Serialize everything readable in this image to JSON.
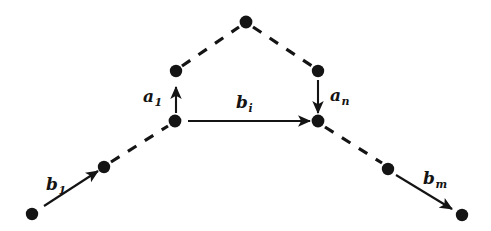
{
  "figure": {
    "type": "node-link-path-diagram",
    "background_color": "#ffffff",
    "ink_color": "#141414"
  },
  "labels": {
    "b1": {
      "base": "b",
      "sub": "1",
      "text": "b1"
    },
    "bi": {
      "base": "b",
      "sub": "i",
      "text": "bi"
    },
    "bm": {
      "base": "b",
      "sub": "m",
      "text": "bm"
    },
    "a1": {
      "base": "a",
      "sub": "1",
      "text": "a1"
    },
    "an": {
      "base": "a",
      "sub": "n",
      "text": "an"
    }
  },
  "nodes": [
    {
      "id": "bottom-left",
      "x": 32,
      "y": 214,
      "r": 6.2
    },
    {
      "id": "lower-left",
      "x": 104,
      "y": 167,
      "r": 6.2
    },
    {
      "id": "mid-left",
      "x": 175,
      "y": 121,
      "r": 6.4
    },
    {
      "id": "upper-left",
      "x": 176,
      "y": 71,
      "r": 6.2
    },
    {
      "id": "apex",
      "x": 246,
      "y": 22,
      "r": 6.4
    },
    {
      "id": "upper-right",
      "x": 318,
      "y": 71,
      "r": 6.2
    },
    {
      "id": "mid-right",
      "x": 318,
      "y": 121,
      "r": 6.4
    },
    {
      "id": "lower-right",
      "x": 388,
      "y": 169,
      "r": 6.2
    },
    {
      "id": "bottom-right",
      "x": 462,
      "y": 215,
      "r": 6.2
    }
  ],
  "edges": [
    {
      "id": "edge-b1",
      "style": "solid",
      "arrow": "end",
      "from": [
        44,
        206
      ],
      "to": [
        98,
        171
      ],
      "label": "b1"
    },
    {
      "id": "edge-dash-ll",
      "style": "dashed",
      "arrow": "none",
      "from": [
        111,
        162
      ],
      "to": [
        168,
        126
      ],
      "label": ""
    },
    {
      "id": "edge-a1",
      "style": "solid",
      "arrow": "end",
      "from": [
        176,
        113
      ],
      "to": [
        176,
        87
      ],
      "label": "a1"
    },
    {
      "id": "edge-dash-ul",
      "style": "dashed",
      "arrow": "none",
      "from": [
        182,
        66
      ],
      "to": [
        239,
        27
      ],
      "label": ""
    },
    {
      "id": "edge-dash-ur",
      "style": "dashed",
      "arrow": "none",
      "from": [
        253,
        27
      ],
      "to": [
        312,
        66
      ],
      "label": ""
    },
    {
      "id": "edge-an",
      "style": "solid",
      "arrow": "end",
      "from": [
        318,
        80
      ],
      "to": [
        318,
        113
      ],
      "label": "an"
    },
    {
      "id": "edge-bi",
      "style": "solid",
      "arrow": "end",
      "from": [
        188,
        121
      ],
      "to": [
        310,
        121
      ],
      "label": "bi"
    },
    {
      "id": "edge-dash-lr",
      "style": "dashed",
      "arrow": "none",
      "from": [
        325,
        127
      ],
      "to": [
        382,
        163
      ],
      "label": ""
    },
    {
      "id": "edge-bm",
      "style": "solid",
      "arrow": "end",
      "from": [
        396,
        175
      ],
      "to": [
        452,
        209
      ],
      "label": "bm"
    }
  ]
}
